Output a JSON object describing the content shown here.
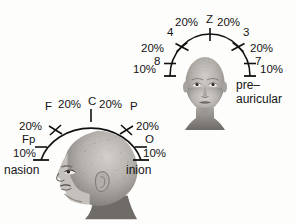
{
  "figure": {
    "background_color": "#fdfdfc",
    "line_color": "#111111",
    "text_color": "#141414"
  },
  "coronal_view": {
    "name": "frontal-coronal-head-view",
    "head_label": "frontal head illustration",
    "arc_segments": [
      {
        "id": "left-lower",
        "value": "10%"
      },
      {
        "id": "left-upper",
        "value": "20%"
      },
      {
        "id": "left-vertex",
        "value": "20%"
      },
      {
        "id": "right-vertex",
        "value": "20%"
      },
      {
        "id": "right-upper",
        "value": "20%"
      },
      {
        "id": "right-lower",
        "value": "10%"
      }
    ],
    "electrode_sites": [
      {
        "id": "site-8",
        "label": "8"
      },
      {
        "id": "site-4",
        "label": "4"
      },
      {
        "id": "site-z",
        "label": "Z"
      },
      {
        "id": "site-3",
        "label": "3"
      },
      {
        "id": "site-7",
        "label": "7"
      }
    ],
    "landmarks": [
      {
        "id": "pre-auricular",
        "line1": "pre–",
        "line2": "auricular"
      }
    ]
  },
  "sagittal_view": {
    "name": "sagittal-profile-head-view",
    "head_label": "profile head illustration",
    "arc_segments": [
      {
        "id": "front-lower",
        "value": "10%"
      },
      {
        "id": "front-upper",
        "value": "20%"
      },
      {
        "id": "front-vertex",
        "value": "20%"
      },
      {
        "id": "back-vertex",
        "value": "20%"
      },
      {
        "id": "back-upper",
        "value": "20%"
      },
      {
        "id": "back-lower",
        "value": "10%"
      }
    ],
    "electrode_sites": [
      {
        "id": "site-fp",
        "label": "Fp"
      },
      {
        "id": "site-f",
        "label": "F"
      },
      {
        "id": "site-c",
        "label": "C"
      },
      {
        "id": "site-p",
        "label": "P"
      },
      {
        "id": "site-o",
        "label": "O"
      }
    ],
    "landmarks": [
      {
        "id": "nasion",
        "label": "nasion"
      },
      {
        "id": "inion",
        "label": "inion"
      }
    ]
  }
}
